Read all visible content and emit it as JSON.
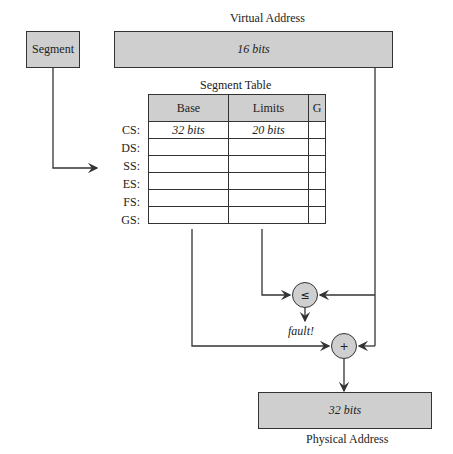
{
  "virtual_address": {
    "title": "Virtual Address",
    "value": "16 bits"
  },
  "segment": {
    "label": "Segment"
  },
  "segment_table": {
    "title": "Segment Table",
    "headers": [
      "Base",
      "Limits",
      "G"
    ],
    "rows": [
      {
        "reg": "CS:",
        "base": "32 bits",
        "limits": "20 bits",
        "g": ""
      },
      {
        "reg": "DS:",
        "base": "",
        "limits": "",
        "g": ""
      },
      {
        "reg": "SS:",
        "base": "",
        "limits": "",
        "g": ""
      },
      {
        "reg": "ES:",
        "base": "",
        "limits": "",
        "g": ""
      },
      {
        "reg": "FS:",
        "base": "",
        "limits": "",
        "g": ""
      },
      {
        "reg": "GS:",
        "base": "",
        "limits": "",
        "g": ""
      }
    ]
  },
  "compare": {
    "symbol": "≤",
    "output": "fault!"
  },
  "adder": {
    "symbol": "+"
  },
  "physical_address": {
    "title": "Physical Address",
    "value": "32 bits"
  },
  "colors": {
    "fill": "#cfcfcf",
    "stroke": "#333333"
  }
}
